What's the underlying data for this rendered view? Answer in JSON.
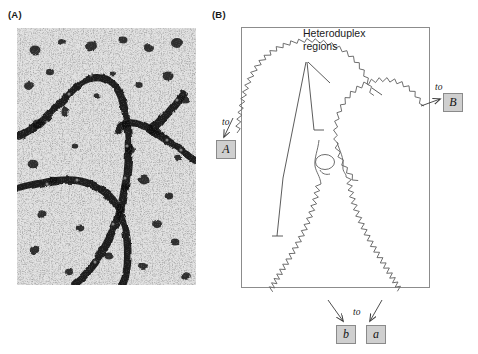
{
  "figure": {
    "type": "two-panel scientific figure"
  },
  "panels": {
    "a": {
      "label": "(A)",
      "content_kind": "electron-micrograph",
      "description": "Dark stained DNA duplex strands forming a chi-shaped Holliday junction on a grainy background"
    },
    "b": {
      "label": "(B)",
      "content_kind": "line-schematic",
      "description": "Interpretive drawing of the micrograph with four duplex arms meeting at a central junction"
    }
  },
  "annotations": {
    "heteroduplex": {
      "line1": "Heteroduplex",
      "line2": "regions"
    },
    "to_label": "to"
  },
  "arm_tags": [
    {
      "id": "A",
      "label": "A",
      "position": "upper-left",
      "to": "to"
    },
    {
      "id": "B",
      "label": "B",
      "position": "upper-right",
      "to": "to"
    },
    {
      "id": "b",
      "label": "b",
      "position": "lower-left",
      "to": "to"
    },
    {
      "id": "a",
      "label": "a",
      "position": "lower-right",
      "to": "to"
    }
  ],
  "colors": {
    "strand": "#6e6e6e",
    "leader": "#5a5a5a",
    "box_border": "#8c8c8c",
    "tag_fill": "#cfcfcf",
    "tag_border": "#8a8a8a",
    "text": "#1a1a1a",
    "page_background": "#ffffff"
  }
}
